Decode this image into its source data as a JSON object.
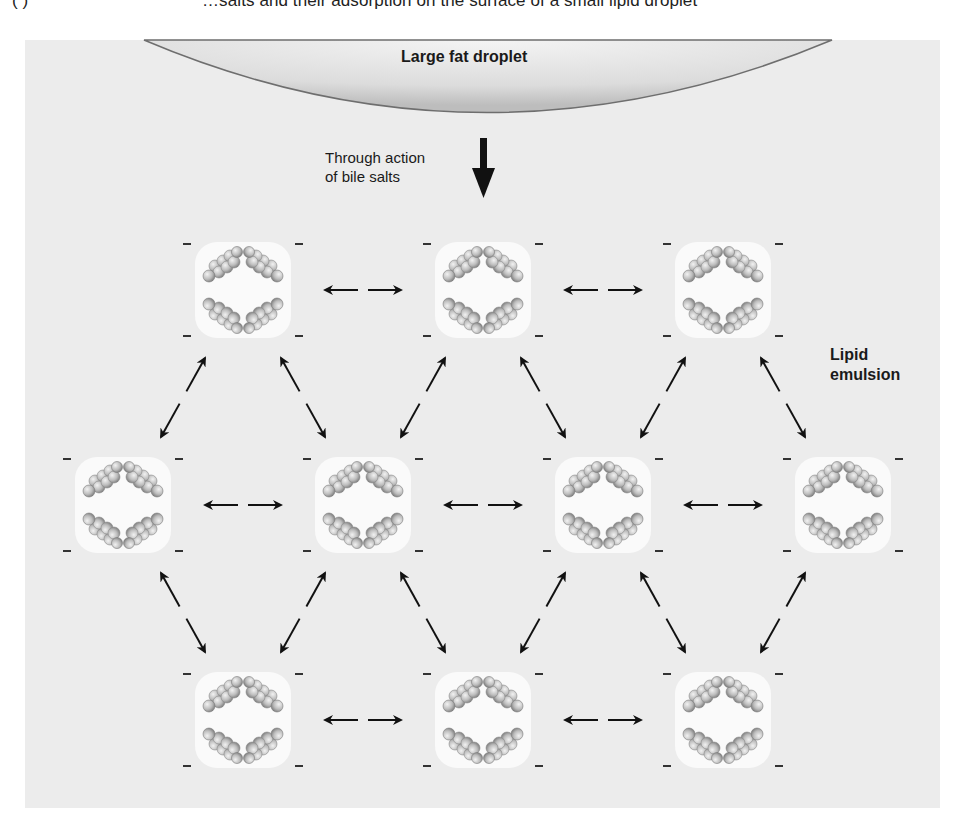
{
  "caption": {
    "panel_marker": "( )",
    "text": "…salts and their adsorption on the surface of a small lipid droplet",
    "note_visible_portion_only": true
  },
  "labels": {
    "large_fat_droplet": "Large fat droplet",
    "action_line1": "Through action",
    "action_line2": "of bile salts",
    "emulsion_line1": "Lipid",
    "emulsion_line2": "emulsion"
  },
  "colors": {
    "panel_background": "#ececec",
    "droplet_core": "#fafafa",
    "fat_droplet_fill": "#d6d6d6",
    "arrow": "#111111",
    "molecule": "#b8b8b8",
    "charge": "#333333"
  },
  "diagram": {
    "charge_symbol": "–",
    "droplets": [
      {
        "row": 1,
        "cx": 243,
        "cy": 290
      },
      {
        "row": 1,
        "cx": 483,
        "cy": 290
      },
      {
        "row": 1,
        "cx": 723,
        "cy": 290
      },
      {
        "row": 2,
        "cx": 123,
        "cy": 505
      },
      {
        "row": 2,
        "cx": 363,
        "cy": 505
      },
      {
        "row": 2,
        "cx": 603,
        "cy": 505
      },
      {
        "row": 2,
        "cx": 843,
        "cy": 505
      },
      {
        "row": 3,
        "cx": 243,
        "cy": 720
      },
      {
        "row": 3,
        "cx": 483,
        "cy": 720
      },
      {
        "row": 3,
        "cx": 723,
        "cy": 720
      }
    ],
    "horizontal_links": [
      [
        0,
        1
      ],
      [
        1,
        2
      ],
      [
        3,
        4
      ],
      [
        4,
        5
      ],
      [
        5,
        6
      ],
      [
        7,
        8
      ],
      [
        8,
        9
      ]
    ],
    "diagonal_links": [
      [
        0,
        3
      ],
      [
        0,
        4
      ],
      [
        1,
        4
      ],
      [
        1,
        5
      ],
      [
        2,
        5
      ],
      [
        2,
        6
      ],
      [
        3,
        7
      ],
      [
        4,
        7
      ],
      [
        4,
        8
      ],
      [
        5,
        8
      ],
      [
        5,
        9
      ],
      [
        6,
        9
      ]
    ]
  }
}
